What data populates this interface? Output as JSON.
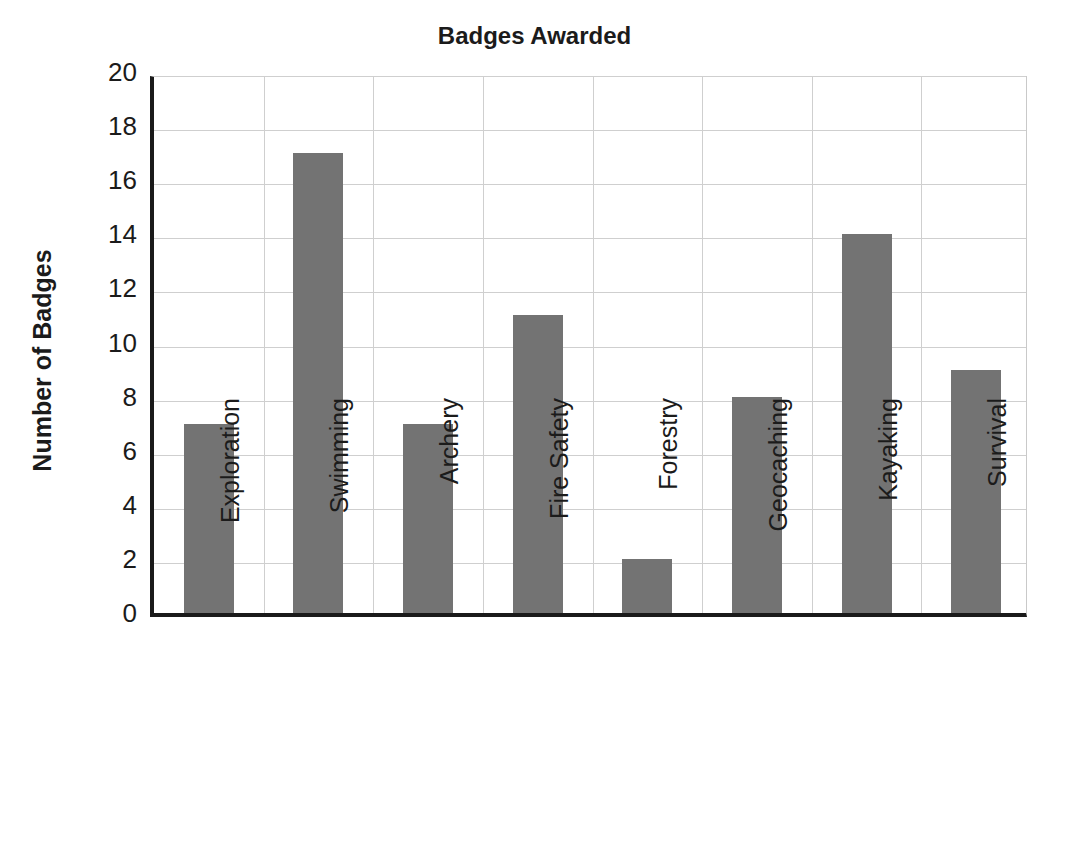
{
  "chart_data": {
    "type": "bar",
    "title": "Badges Awarded",
    "xlabel": "",
    "ylabel": "Number of Badges",
    "categories": [
      "Exploration",
      "Swimming",
      "Archery",
      "Fire Safety",
      "Forestry",
      "Geocaching",
      "Kayaking",
      "Survival"
    ],
    "values": [
      7,
      17,
      7,
      11,
      2,
      8,
      14,
      9
    ],
    "ylim": [
      0,
      20
    ],
    "ytick_step": 2,
    "yticks": [
      "20",
      "18",
      "16",
      "14",
      "12",
      "10",
      "8",
      "6",
      "4",
      "2",
      "0"
    ],
    "grid": true,
    "legend": false,
    "bar_color": "#737373",
    "axis_color": "#1a1a1a",
    "grid_color": "#cfcfcf",
    "background_color": "#ffffff"
  }
}
